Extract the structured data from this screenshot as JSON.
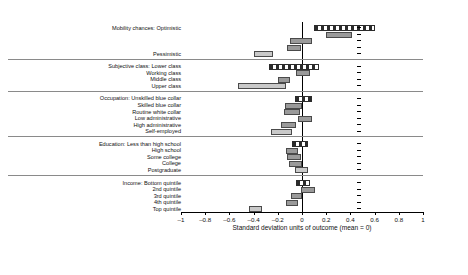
{
  "chart_data": {
    "type": "bar",
    "title": "",
    "subtitle": "",
    "xlabel": "Standard deviation units of outcome (mean = 0)",
    "ylabel": "",
    "xlim": [
      -1,
      1
    ],
    "xticks": [
      -1,
      -0.8,
      -0.6,
      -0.4,
      -0.2,
      0,
      0.2,
      0.4,
      0.6,
      0.8,
      1
    ],
    "xticklabels": [
      "–1",
      "–0.8",
      "–0.6",
      "–0.4",
      "–0.2",
      "0",
      "0.2",
      "0.4",
      "0.6",
      "0.8",
      "1"
    ],
    "grid": false,
    "legend": null,
    "zero_reference_line": 0,
    "orientation": "horizontal",
    "note": "Horizontal interval (confidence-interval) bars; hatched bars mark reference categories.",
    "groups": [
      {
        "name": "Mobility chances",
        "rows": [
          {
            "label": "Mobility chances: Optimistic",
            "low": 0.1,
            "high": 0.6,
            "style": "reference"
          },
          {
            "label": "",
            "low": 0.2,
            "high": 0.41,
            "style": "solid"
          },
          {
            "label": "",
            "low": -0.1,
            "high": 0.08,
            "style": "solid"
          },
          {
            "label": "",
            "low": -0.12,
            "high": -0.01,
            "style": "solid"
          },
          {
            "label": "Pessimistic",
            "low": -0.4,
            "high": -0.24,
            "style": "light"
          }
        ]
      },
      {
        "name": "Subjective class",
        "rows": [
          {
            "label": "Subjective class: Lower class",
            "low": -0.27,
            "high": 0.14,
            "style": "reference"
          },
          {
            "label": "Working class",
            "low": -0.05,
            "high": 0.07,
            "style": "solid"
          },
          {
            "label": "Middle class",
            "low": -0.2,
            "high": -0.1,
            "style": "solid"
          },
          {
            "label": "Upper class",
            "low": -0.53,
            "high": -0.13,
            "style": "light"
          }
        ]
      },
      {
        "name": "Occupation",
        "rows": [
          {
            "label": "Occupation: Unskilled blue collar",
            "low": -0.06,
            "high": 0.08,
            "style": "reference"
          },
          {
            "label": "Skilled blue collar",
            "low": -0.14,
            "high": 0.0,
            "style": "solid"
          },
          {
            "label": "Routine white collar",
            "low": -0.15,
            "high": -0.02,
            "style": "solid"
          },
          {
            "label": "Low administrative",
            "low": -0.03,
            "high": 0.08,
            "style": "solid"
          },
          {
            "label": "High administrative",
            "low": -0.17,
            "high": -0.05,
            "style": "solid"
          },
          {
            "label": "Self-employed",
            "low": -0.26,
            "high": -0.08,
            "style": "light"
          }
        ]
      },
      {
        "name": "Education",
        "rows": [
          {
            "label": "Education: Less than high school",
            "low": -0.08,
            "high": 0.05,
            "style": "reference"
          },
          {
            "label": "High school",
            "low": -0.13,
            "high": -0.03,
            "style": "solid"
          },
          {
            "label": "Some college",
            "low": -0.12,
            "high": -0.01,
            "style": "solid"
          },
          {
            "label": "College",
            "low": -0.11,
            "high": 0.0,
            "style": "solid"
          },
          {
            "label": "Postgraduate",
            "low": -0.06,
            "high": 0.05,
            "style": "light"
          }
        ]
      },
      {
        "name": "Income",
        "rows": [
          {
            "label": "Income: Bottom quintile",
            "low": -0.05,
            "high": 0.07,
            "style": "reference"
          },
          {
            "label": "2nd quintile",
            "low": -0.01,
            "high": 0.11,
            "style": "solid"
          },
          {
            "label": "3rd quintile",
            "low": -0.09,
            "high": 0.0,
            "style": "solid"
          },
          {
            "label": "4th quintile",
            "low": -0.13,
            "high": -0.03,
            "style": "solid"
          },
          {
            "label": "Top quintile",
            "low": -0.44,
            "high": -0.33,
            "style": "light"
          }
        ]
      }
    ]
  }
}
